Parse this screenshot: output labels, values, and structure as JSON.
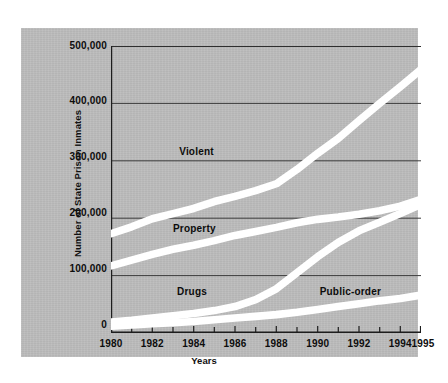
{
  "chart_data": {
    "type": "line",
    "title": "",
    "xlabel": "Years",
    "ylabel": "Number of State Prison Inmates",
    "x": [
      1980,
      1981,
      1982,
      1983,
      1984,
      1985,
      1986,
      1987,
      1988,
      1989,
      1990,
      1991,
      1992,
      1993,
      1994,
      1995
    ],
    "xlim": [
      1980,
      1995
    ],
    "ylim": [
      0,
      500000
    ],
    "yticks": [
      0,
      100000,
      200000,
      300000,
      400000,
      500000
    ],
    "ytick_labels": [
      "0",
      "100,000",
      "200,000",
      "300,000",
      "400,000",
      "500,000"
    ],
    "xtick_labels": [
      "1980",
      "1982",
      "1984",
      "1986",
      "1988",
      "1990",
      "1992",
      "1994",
      "1995"
    ],
    "xtick_values": [
      1980,
      1982,
      1984,
      1986,
      1988,
      1990,
      1992,
      1994,
      1995
    ],
    "grid": "horizontal",
    "legend": "inline-labels",
    "line_style": "thick-white-band-on-gray",
    "series": [
      {
        "name": "Violent",
        "label": "Violent",
        "color": "#ffffff",
        "values": [
          173000,
          185000,
          199000,
          208000,
          217000,
          229000,
          238000,
          248000,
          260000,
          285000,
          313000,
          339000,
          370000,
          400000,
          429000,
          459000
        ]
      },
      {
        "name": "Property",
        "label": "Property",
        "color": "#ffffff",
        "values": [
          117000,
          127000,
          137000,
          146000,
          153000,
          161000,
          170000,
          177000,
          184000,
          192000,
          198000,
          202000,
          207000,
          213000,
          221000,
          233000
        ]
      },
      {
        "name": "Drugs",
        "label": "Drugs",
        "color": "#ffffff",
        "values": [
          19000,
          22000,
          26000,
          30000,
          34000,
          39000,
          46000,
          58000,
          77000,
          105000,
          133000,
          158000,
          178000,
          193000,
          208000,
          224000
        ]
      },
      {
        "name": "Public-order",
        "label": "Public-order",
        "color": "#ffffff",
        "values": [
          12000,
          14000,
          16000,
          18000,
          20000,
          23000,
          26000,
          29000,
          32000,
          36000,
          41000,
          46000,
          51000,
          56000,
          60000,
          66000
        ]
      }
    ],
    "annotations": [
      {
        "text": "Violent",
        "x": 1983.3,
        "y": 315000
      },
      {
        "text": "Property",
        "x": 1983.0,
        "y": 182000
      },
      {
        "text": "Drugs",
        "x": 1983.2,
        "y": 72000
      },
      {
        "text": "Public-order",
        "x": 1990.1,
        "y": 72000
      }
    ],
    "colors": {
      "panel_background": "#bcbcbc",
      "figure_background": "#ffffff",
      "line": "#ffffff",
      "gridline": "#3a3a3a",
      "axis": "#1a1a1a",
      "text": "#0d0d0d"
    }
  }
}
